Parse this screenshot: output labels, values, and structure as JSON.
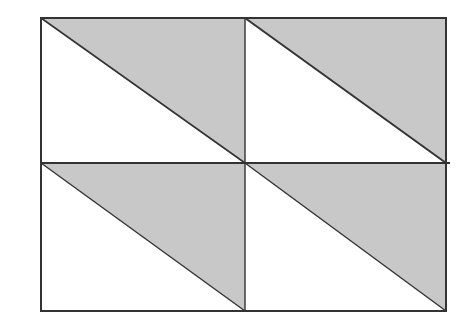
{
  "diagram": {
    "rows": 2,
    "cols": 2,
    "shaded_region": "upper-right triangle of each cell",
    "colors": {
      "background": "#ffffff",
      "shade": "#c8c8c8",
      "stroke": "#333333"
    }
  }
}
